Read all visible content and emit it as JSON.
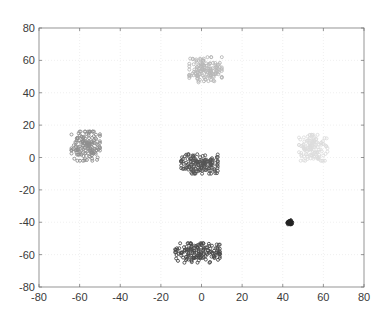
{
  "chart_data": {
    "type": "scatter",
    "title": "",
    "xlabel": "",
    "ylabel": "",
    "xlim": [
      -80,
      80
    ],
    "ylim": [
      -80,
      80
    ],
    "xticks": [
      -80,
      -60,
      -40,
      -20,
      0,
      20,
      40,
      60,
      80
    ],
    "yticks": [
      -80,
      -60,
      -40,
      -20,
      0,
      20,
      40,
      60,
      80
    ],
    "xtick_labels": [
      "-80",
      "-60",
      "-40",
      "-20",
      "0",
      "20",
      "40",
      "60",
      "80"
    ],
    "ytick_labels": [
      "-80",
      "-60",
      "-40",
      "-20",
      "0",
      "20",
      "40",
      "60",
      "80"
    ],
    "grid": true,
    "legend": null,
    "series": [
      {
        "name": "cluster-top",
        "color": "#b8b8b8",
        "center": [
          2,
          54
        ],
        "spread": [
          8,
          8
        ],
        "count": 140,
        "seed": 11
      },
      {
        "name": "cluster-left",
        "color": "#8f8f8f",
        "center": [
          -57,
          7
        ],
        "spread": [
          7,
          9
        ],
        "count": 150,
        "seed": 23
      },
      {
        "name": "cluster-center",
        "color": "#555555",
        "center": [
          -1,
          -4
        ],
        "spread": [
          9,
          6
        ],
        "count": 150,
        "seed": 37
      },
      {
        "name": "cluster-right",
        "color": "#dcdcdc",
        "center": [
          55,
          6
        ],
        "spread": [
          7,
          8
        ],
        "count": 130,
        "seed": 41
      },
      {
        "name": "cluster-small-dark",
        "color": "#222222",
        "center": [
          43.5,
          -40
        ],
        "spread": [
          1.3,
          1.3
        ],
        "count": 40,
        "seed": 53
      },
      {
        "name": "cluster-bottom",
        "color": "#4a4a4a",
        "center": [
          -2,
          -59
        ],
        "spread": [
          11,
          6
        ],
        "count": 150,
        "seed": 67
      }
    ]
  },
  "plot": {
    "left": 39,
    "right": 364,
    "top": 28,
    "bottom": 287,
    "axis_color": "#7a7a7a",
    "grid_color": "#e6e6e6",
    "background": "#ffffff"
  }
}
